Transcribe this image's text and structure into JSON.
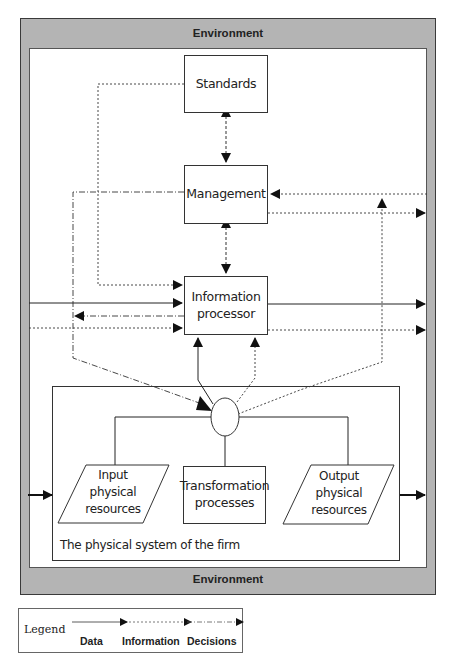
{
  "environment": {
    "top_label": "Environment",
    "bottom_label": "Environment",
    "fill_color": "#b4b4b4"
  },
  "nodes": {
    "standards": {
      "label": "Standards"
    },
    "management": {
      "label": "Management"
    },
    "information_processor": {
      "label": "Information processor",
      "line1": "Information",
      "line2": "processor"
    },
    "physical_system": {
      "label": "The physical system of the firm"
    },
    "input_resources": {
      "line1": "Input",
      "line2": "physical",
      "line3": "resources"
    },
    "transformation": {
      "line1": "Transformation",
      "line2": "processes"
    },
    "output_resources": {
      "line1": "Output",
      "line2": "physical",
      "line3": "resources"
    }
  },
  "edges": [
    {
      "from": "standards",
      "to": "management",
      "type": "information",
      "bidirectional": true
    },
    {
      "from": "management",
      "to": "information_processor",
      "type": "information",
      "bidirectional": true
    },
    {
      "from": "standards",
      "to": "information_processor",
      "type": "information"
    },
    {
      "from": "management",
      "to": "physical_system",
      "type": "decisions"
    },
    {
      "from": "environment",
      "to": "management",
      "type": "information"
    },
    {
      "from": "management",
      "to": "environment",
      "type": "information"
    },
    {
      "from": "environment",
      "to": "information_processor",
      "type": "data"
    },
    {
      "from": "information_processor",
      "to": "environment",
      "type": "data"
    },
    {
      "from": "environment",
      "to": "information_processor",
      "type": "information"
    },
    {
      "from": "information_processor",
      "to": "environment",
      "type": "information"
    },
    {
      "from": "information_processor",
      "to": "physical_system",
      "type": "decisions"
    },
    {
      "from": "physical_system",
      "to": "information_processor",
      "type": "data"
    },
    {
      "from": "physical_system",
      "to": "information_processor",
      "type": "information"
    },
    {
      "from": "physical_system",
      "to": "management",
      "type": "information"
    },
    {
      "from": "environment",
      "to": "input_resources",
      "type": "data"
    },
    {
      "from": "output_resources",
      "to": "environment",
      "type": "data"
    }
  ],
  "legend": {
    "title": "Legend",
    "items": [
      {
        "label": "Data",
        "style": "solid"
      },
      {
        "label": "Information",
        "style": "dotted"
      },
      {
        "label": "Decisions",
        "style": "dash-dot"
      }
    ]
  }
}
